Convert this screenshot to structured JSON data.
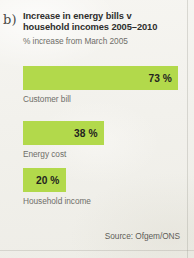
{
  "panel": {
    "letter": "b)"
  },
  "chart_data": {
    "type": "bar",
    "orientation": "horizontal",
    "title_line_1": "Increase in energy bills v",
    "title_line_2": "household incomes 2005–2010",
    "subtitle": "% increase from March 2005",
    "xlabel": "",
    "ylabel": "",
    "categories": [
      "Customer bill",
      "Energy cost",
      "Household income"
    ],
    "values": [
      73,
      38,
      20
    ],
    "value_labels": [
      "73 %",
      "38 %",
      "20 %"
    ],
    "unit": "%",
    "xlim": [
      0,
      73
    ],
    "grid": false,
    "legend": false,
    "bar_color": "#b2d94b",
    "value_text_color": "#23231f",
    "category_text_color": "#6f6e69",
    "source": "Source: Ofgem/ONS"
  }
}
